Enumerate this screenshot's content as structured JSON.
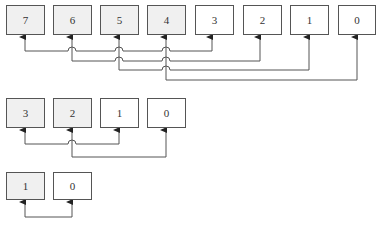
{
  "diagram": {
    "type": "butterfly-pairing",
    "colors": {
      "stroke": "#555555",
      "shaded_fill": "#f0f0f0",
      "plain_fill": "#ffffff"
    },
    "rows": [
      {
        "name": "stage-8",
        "nodes": [
          {
            "label": "7",
            "shaded": true
          },
          {
            "label": "6",
            "shaded": true
          },
          {
            "label": "5",
            "shaded": true
          },
          {
            "label": "4",
            "shaded": true
          },
          {
            "label": "3",
            "shaded": false
          },
          {
            "label": "2",
            "shaded": false
          },
          {
            "label": "1",
            "shaded": false
          },
          {
            "label": "0",
            "shaded": false
          }
        ],
        "connections": [
          [
            "7",
            "3"
          ],
          [
            "6",
            "2"
          ],
          [
            "5",
            "1"
          ],
          [
            "4",
            "0"
          ]
        ]
      },
      {
        "name": "stage-4",
        "nodes": [
          {
            "label": "3",
            "shaded": true
          },
          {
            "label": "2",
            "shaded": true
          },
          {
            "label": "1",
            "shaded": false
          },
          {
            "label": "0",
            "shaded": false
          }
        ],
        "connections": [
          [
            "3",
            "1"
          ],
          [
            "2",
            "0"
          ]
        ]
      },
      {
        "name": "stage-2",
        "nodes": [
          {
            "label": "1",
            "shaded": true
          },
          {
            "label": "0",
            "shaded": false
          }
        ],
        "connections": [
          [
            "1",
            "0"
          ]
        ]
      }
    ]
  }
}
